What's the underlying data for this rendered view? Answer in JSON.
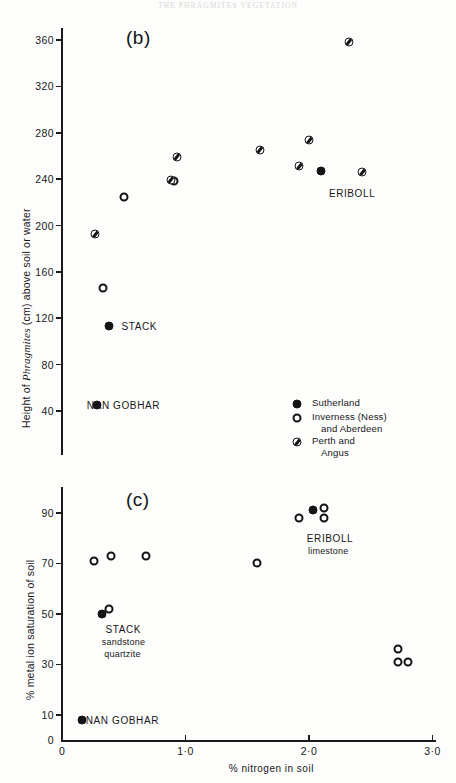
{
  "page": {
    "running_head": "The Phragmites vegetation"
  },
  "panel_b": {
    "letter": "(b)",
    "y_axis_title_prefix": "Height of ",
    "y_axis_title_italic": "Phragmites",
    "y_axis_title_suffix": " (cm) above soil or water",
    "y_ticks": [
      "360",
      "320",
      "280",
      "240",
      "200",
      "160",
      "120",
      "80",
      "40"
    ],
    "annotations": [
      {
        "text": "ERIBOLL",
        "x": 2.08,
        "y": 228
      },
      {
        "text": "STACK",
        "x": 0.4,
        "y": 113
      },
      {
        "text": "NAN GOBHAR",
        "x": 0.12,
        "y": 45
      }
    ]
  },
  "panel_c": {
    "letter": "(c)",
    "y_axis_title": "% metal ion saturation of soil",
    "y_ticks": [
      "90",
      "70",
      "50",
      "30",
      "10",
      "0"
    ],
    "annotations": [
      {
        "text": "ERIBOLL",
        "x": 1.95,
        "y": 80
      },
      {
        "text": "limestone",
        "x": 1.96,
        "y": 75
      },
      {
        "text": "STACK",
        "x": 0.32,
        "y": 44
      },
      {
        "text": "sandstone",
        "x": 0.29,
        "y": 39
      },
      {
        "text": "quartzite",
        "x": 0.31,
        "y": 34
      },
      {
        "text": "NAN GOBHAR",
        "x": 0.16,
        "y": 8
      }
    ]
  },
  "x_axis": {
    "title": "% nitrogen in soil",
    "ticks": [
      "0",
      "1·0",
      "2·0",
      "3·0"
    ],
    "tick_values": [
      0,
      1,
      2,
      3
    ]
  },
  "legend": {
    "items": [
      {
        "marker": "filled",
        "label": "Sutherland",
        "continuation": ""
      },
      {
        "marker": "open",
        "label": "Inverness (Ness)",
        "continuation": "and Aberdeen"
      },
      {
        "marker": "half",
        "label": "Perth and",
        "continuation": "Angus"
      }
    ]
  },
  "colors": {
    "ink": "#141417",
    "paper": "#fdfdfc"
  },
  "chart_data": [
    {
      "type": "scatter",
      "panel": "(b)",
      "title": "(b)",
      "xlabel": "% nitrogen in soil",
      "ylabel": "Height of Phragmites (cm) above soil or water",
      "xlim": [
        0,
        3.05
      ],
      "ylim": [
        20,
        380
      ],
      "grid": false,
      "legend_position": "inside-lower-right",
      "series": [
        {
          "name": "Sutherland",
          "marker": "filled",
          "points": [
            {
              "x": 0.28,
              "y": 45
            },
            {
              "x": 0.38,
              "y": 113
            },
            {
              "x": 2.1,
              "y": 247
            }
          ]
        },
        {
          "name": "Inverness (Ness) and Aberdeen",
          "marker": "open",
          "points": [
            {
              "x": 0.33,
              "y": 146
            },
            {
              "x": 0.5,
              "y": 225
            },
            {
              "x": 0.91,
              "y": 238
            }
          ]
        },
        {
          "name": "Perth and Angus",
          "marker": "half",
          "points": [
            {
              "x": 0.27,
              "y": 193
            },
            {
              "x": 0.88,
              "y": 239
            },
            {
              "x": 0.93,
              "y": 259
            },
            {
              "x": 1.6,
              "y": 265
            },
            {
              "x": 1.92,
              "y": 251
            },
            {
              "x": 2.0,
              "y": 274
            },
            {
              "x": 2.32,
              "y": 358
            },
            {
              "x": 2.43,
              "y": 246
            }
          ]
        }
      ]
    },
    {
      "type": "scatter",
      "panel": "(c)",
      "title": "(c)",
      "xlabel": "% nitrogen in soil",
      "ylabel": "% metal ion saturation of soil",
      "xlim": [
        0,
        3.05
      ],
      "ylim": [
        0,
        100
      ],
      "grid": false,
      "legend_position": "none",
      "series": [
        {
          "name": "Sutherland",
          "marker": "filled",
          "points": [
            {
              "x": 0.16,
              "y": 8
            },
            {
              "x": 0.32,
              "y": 50
            },
            {
              "x": 2.03,
              "y": 91
            }
          ]
        },
        {
          "name": "Inverness (Ness) and Aberdeen",
          "marker": "open",
          "points": [
            {
              "x": 0.38,
              "y": 52
            },
            {
              "x": 0.26,
              "y": 71
            },
            {
              "x": 0.4,
              "y": 73
            },
            {
              "x": 0.68,
              "y": 73
            },
            {
              "x": 1.58,
              "y": 70
            },
            {
              "x": 1.92,
              "y": 88
            },
            {
              "x": 2.12,
              "y": 92
            },
            {
              "x": 2.72,
              "y": 31
            },
            {
              "x": 2.8,
              "y": 31
            },
            {
              "x": 2.72,
              "y": 36
            },
            {
              "x": 2.12,
              "y": 88
            }
          ]
        }
      ]
    }
  ]
}
